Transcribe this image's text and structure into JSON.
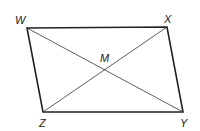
{
  "figure": {
    "type": "parallelogram",
    "vertices": [
      {
        "name": "W",
        "x": 27,
        "y": 28
      },
      {
        "name": "X",
        "x": 167,
        "y": 27
      },
      {
        "name": "Y",
        "x": 183,
        "y": 112
      },
      {
        "name": "Z",
        "x": 43,
        "y": 112
      }
    ],
    "intersection": {
      "name": "M",
      "x": 105,
      "y": 69
    },
    "labels": {
      "W": "W",
      "X": "X",
      "Y": "Y",
      "Z": "Z",
      "M": "M"
    },
    "sides": [
      "WX",
      "XY",
      "YZ",
      "ZW"
    ],
    "diagonals": [
      "WY",
      "XZ"
    ],
    "colors": {
      "stroke": "#222222",
      "background": "#ffffff"
    }
  }
}
